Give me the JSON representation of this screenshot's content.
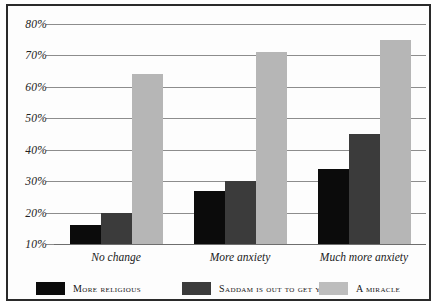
{
  "chart_data": {
    "type": "bar",
    "title": "",
    "subtitle": "",
    "xlabel": "",
    "ylabel": "",
    "categories": [
      "No change",
      "More anxiety",
      "Much more anxiety"
    ],
    "series": [
      {
        "name": "More religious",
        "color": "#0b0b0b",
        "values": [
          16,
          27,
          34
        ]
      },
      {
        "name": "Saddam is out to get you",
        "color": "#3b3b3b",
        "values": [
          20,
          30,
          45
        ]
      },
      {
        "name": "A miracle",
        "color": "#b6b6b6",
        "values": [
          64,
          71,
          75
        ]
      }
    ],
    "ylim": [
      10,
      80
    ],
    "ytick_labels": [
      "10%",
      "20%",
      "30%",
      "40%",
      "50%",
      "60%",
      "70%",
      "80%"
    ],
    "ytick_values": [
      10,
      20,
      30,
      40,
      50,
      60,
      70,
      80
    ],
    "grid": true,
    "legend_position": "bottom",
    "value_suffix": "%"
  },
  "legend": {
    "items": [
      {
        "label": "More religious"
      },
      {
        "label": "Saddam is out to get you"
      },
      {
        "label": "A miracle"
      }
    ]
  }
}
